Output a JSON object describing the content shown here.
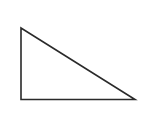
{
  "diagram": {
    "background": "#ffffff",
    "shape": {
      "type": "right-triangle",
      "stroke": "#2a2a2a",
      "fill": "#ffffff",
      "stroke_width": 1.6,
      "vertices": {
        "top_left": [
          21,
          28
        ],
        "bottom_left": [
          21,
          99.5
        ],
        "bottom_right": [
          135,
          99.5
        ]
      },
      "right_angle_at": "bottom_left"
    }
  }
}
